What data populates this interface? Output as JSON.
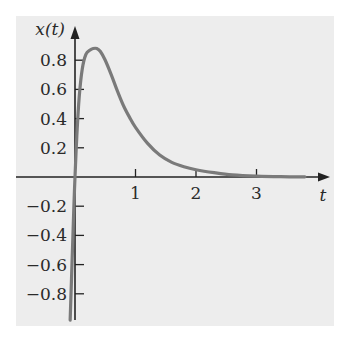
{
  "chart_data": {
    "type": "line",
    "title": "",
    "xlabel": "t",
    "ylabel": "x(t)",
    "xlim": [
      -0.1,
      3.9
    ],
    "ylim": [
      -1.0,
      1.0
    ],
    "x_ticks": [
      1,
      2,
      3
    ],
    "x_tick_labels": [
      "1",
      "2",
      "3"
    ],
    "y_ticks": [
      0.8,
      0.6,
      0.4,
      0.2,
      -0.2,
      -0.4,
      -0.6,
      -0.8
    ],
    "y_tick_labels": [
      "0.8",
      "0.6",
      "0.4",
      "0.2",
      "−0.2",
      "−0.4",
      "−0.6",
      "−0.8"
    ],
    "grid": false,
    "legend": null,
    "series": [
      {
        "name": "x(t)",
        "color": "#7a7a7a",
        "x": [
          -0.08,
          -0.05,
          -0.02,
          0.0,
          0.03,
          0.07,
          0.12,
          0.18,
          0.25,
          0.3,
          0.36,
          0.42,
          0.5,
          0.6,
          0.7,
          0.8,
          0.9,
          1.0,
          1.2,
          1.4,
          1.6,
          1.8,
          2.0,
          2.3,
          2.6,
          3.0,
          3.4,
          3.8
        ],
        "y": [
          -0.98,
          -0.6,
          -0.22,
          0.0,
          0.28,
          0.55,
          0.74,
          0.84,
          0.87,
          0.88,
          0.88,
          0.86,
          0.8,
          0.7,
          0.59,
          0.49,
          0.41,
          0.34,
          0.23,
          0.15,
          0.1,
          0.07,
          0.05,
          0.03,
          0.015,
          0.006,
          0.002,
          0.001
        ]
      }
    ]
  },
  "colors": {
    "background": "#ededed",
    "axis": "#222222",
    "curve": "#7a7a7a"
  }
}
